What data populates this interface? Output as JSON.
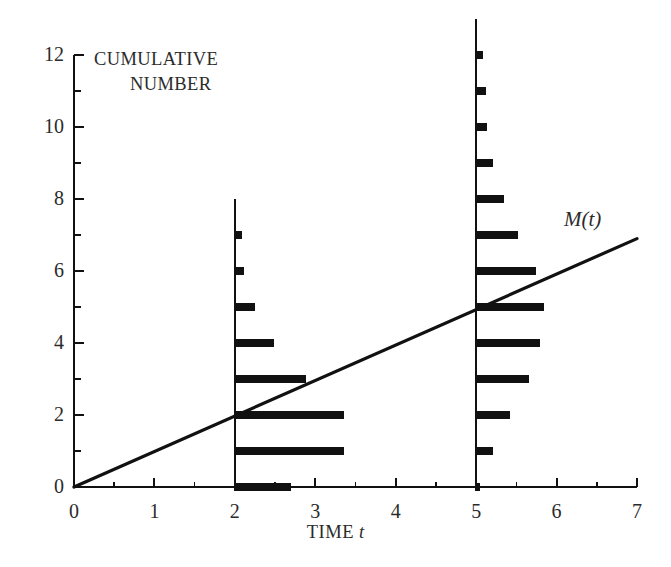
{
  "figure": {
    "background": "#ffffff",
    "ink_color": "#1a1a1a",
    "text_color": "#2b2b2b"
  },
  "annotations": {
    "y_axis_caption_line_1": "CUMULATIVE",
    "y_axis_caption_line_2": "NUMBER",
    "curve_label": "M(t)",
    "x_axis_title_text": "TIME",
    "x_axis_title_variable": "t"
  },
  "axes": {
    "x": {
      "label": "TIME t",
      "min": 0,
      "max": 7,
      "ticks": [
        0,
        1,
        2,
        3,
        4,
        5,
        6,
        7
      ],
      "tick_labels": [
        "0",
        "1",
        "2",
        "3",
        "4",
        "5",
        "6",
        "7"
      ],
      "minor_ticks": [
        0.5,
        1.5,
        2.5,
        3.5,
        4.5,
        5.5,
        6.5
      ]
    },
    "y": {
      "label": "CUMULATIVE NUMBER",
      "min": 0,
      "max": 12,
      "ticks": [
        0,
        2,
        4,
        6,
        8,
        10,
        12
      ],
      "tick_labels": [
        "0",
        "2",
        "4",
        "6",
        "8",
        "10",
        "12"
      ],
      "minor_ticks": [
        1,
        3,
        5,
        7,
        9,
        11
      ]
    },
    "grid": false,
    "legend": "none"
  },
  "chart_data": {
    "type": "line",
    "title": "",
    "subtitle": "",
    "xlabel": "TIME t",
    "ylabel": "CUMULATIVE NUMBER",
    "xlim": [
      0,
      7
    ],
    "ylim": [
      0,
      12
    ],
    "grid": false,
    "legend_position": "inline-annotation",
    "series": [
      {
        "name": "M(t)",
        "type": "line",
        "label": "M(t)",
        "color": "#111111",
        "x": [
          0,
          7
        ],
        "y": [
          0,
          6.9
        ],
        "slope": 0.986,
        "intercept": 0
      },
      {
        "name": "Counting process stems at t = 2",
        "type": "horizontal-bars",
        "color": "#111111",
        "stem_x": 2,
        "stem_top": 8,
        "bars": [
          {
            "level": 0,
            "start_x": 2.0,
            "end_x": 2.7
          },
          {
            "level": 1,
            "start_x": 2.0,
            "end_x": 3.36
          },
          {
            "level": 2,
            "start_x": 2.0,
            "end_x": 3.36
          },
          {
            "level": 3,
            "start_x": 2.0,
            "end_x": 2.89
          },
          {
            "level": 4,
            "start_x": 2.0,
            "end_x": 2.49
          },
          {
            "level": 5,
            "start_x": 2.0,
            "end_x": 2.25
          },
          {
            "level": 6,
            "start_x": 2.0,
            "end_x": 2.11
          },
          {
            "level": 7,
            "start_x": 2.0,
            "end_x": 2.09
          }
        ]
      },
      {
        "name": "Counting process stems at t = 5",
        "type": "horizontal-bars",
        "color": "#111111",
        "stem_x": 5,
        "stem_top": 13,
        "bars": [
          {
            "level": 0,
            "start_x": 5.0,
            "end_x": 5.05
          },
          {
            "level": 1,
            "start_x": 5.0,
            "end_x": 5.21
          },
          {
            "level": 2,
            "start_x": 5.0,
            "end_x": 5.42
          },
          {
            "level": 3,
            "start_x": 5.0,
            "end_x": 5.66
          },
          {
            "level": 4,
            "start_x": 5.0,
            "end_x": 5.8
          },
          {
            "level": 5,
            "start_x": 5.0,
            "end_x": 5.84
          },
          {
            "level": 6,
            "start_x": 5.0,
            "end_x": 5.74
          },
          {
            "level": 7,
            "start_x": 5.0,
            "end_x": 5.52
          },
          {
            "level": 8,
            "start_x": 5.0,
            "end_x": 5.35
          },
          {
            "level": 9,
            "start_x": 5.0,
            "end_x": 5.21
          },
          {
            "level": 10,
            "start_x": 5.0,
            "end_x": 5.14
          },
          {
            "level": 11,
            "start_x": 5.0,
            "end_x": 5.12
          },
          {
            "level": 12,
            "start_x": 5.0,
            "end_x": 5.08
          }
        ]
      }
    ]
  }
}
